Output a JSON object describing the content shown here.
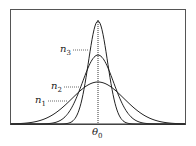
{
  "figure": {
    "type": "gaussian-distributions-diagram",
    "x_axis_label": "θ",
    "x_axis_label_sub": "0",
    "curves": [
      {
        "name": "n1",
        "label": "n",
        "sub": "1",
        "peak_height_rel": 0.41,
        "width_rel": "widest"
      },
      {
        "name": "n2",
        "label": "n",
        "sub": "2",
        "peak_height_rel": 0.67,
        "width_rel": "medium"
      },
      {
        "name": "n3",
        "label": "n",
        "sub": "3",
        "peak_height_rel": 1.0,
        "width_rel": "narrowest"
      }
    ],
    "center_line": "dotted vertical at θ0"
  }
}
